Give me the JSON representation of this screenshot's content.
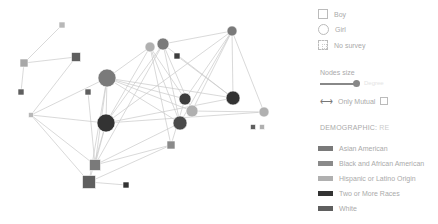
{
  "legend": {
    "shapes": [
      {
        "shape": "square",
        "label": "Boy"
      },
      {
        "shape": "circle",
        "label": "Girl"
      },
      {
        "shape": "no-survey",
        "label": "No survey"
      }
    ],
    "nodes_size": {
      "label": "Nodes size",
      "value": "Degree"
    },
    "only_mutual": {
      "label": "Only Mutual",
      "checked": false
    },
    "demographic": {
      "title": "DEMOGRAPHIC:",
      "selected": "RE",
      "categories": [
        {
          "label": "Asian American",
          "color": "#7a7a7a"
        },
        {
          "label": "Black and African American",
          "color": "#8a8a8a"
        },
        {
          "label": "Hispanic or Latino Origin",
          "color": "#b0b0b0"
        },
        {
          "label": "Two or More Races",
          "color": "#333333"
        },
        {
          "label": "White",
          "color": "#5f5f5f"
        }
      ]
    }
  },
  "graph": {
    "nodes": [
      {
        "id": "n1",
        "shape": "square",
        "x": 62,
        "y": 25,
        "size": 6,
        "color": "#b8b8b8"
      },
      {
        "id": "n2",
        "shape": "square",
        "x": 24,
        "y": 63,
        "size": 8,
        "color": "#a8a8a8"
      },
      {
        "id": "n3",
        "shape": "square",
        "x": 76,
        "y": 57,
        "size": 9,
        "color": "#5f5f5f"
      },
      {
        "id": "n4",
        "shape": "square",
        "x": 21,
        "y": 92,
        "size": 6,
        "color": "#5f5f5f"
      },
      {
        "id": "n5",
        "shape": "circle",
        "x": 107,
        "y": 78,
        "size": 9,
        "color": "#7a7a7a"
      },
      {
        "id": "n6",
        "shape": "square",
        "x": 88,
        "y": 92,
        "size": 6,
        "color": "#5f5f5f"
      },
      {
        "id": "n7",
        "shape": "square",
        "x": 31,
        "y": 115,
        "size": 5,
        "color": "#b8b8b8"
      },
      {
        "id": "n8",
        "shape": "circle",
        "x": 106,
        "y": 123,
        "size": 9,
        "color": "#333333"
      },
      {
        "id": "n9",
        "shape": "square",
        "x": 95,
        "y": 165,
        "size": 11,
        "color": "#7a7a7a"
      },
      {
        "id": "n10",
        "shape": "square",
        "x": 89,
        "y": 182,
        "size": 13,
        "color": "#5f5f5f"
      },
      {
        "id": "n11",
        "shape": "square",
        "x": 126,
        "y": 185,
        "size": 6,
        "color": "#333333"
      },
      {
        "id": "n12",
        "shape": "square",
        "x": 171,
        "y": 145,
        "size": 8,
        "color": "#8a8a8a"
      },
      {
        "id": "n13",
        "shape": "circle",
        "x": 150,
        "y": 47,
        "size": 5,
        "color": "#b0b0b0"
      },
      {
        "id": "n14",
        "shape": "circle",
        "x": 163,
        "y": 44,
        "size": 6,
        "color": "#7a7a7a"
      },
      {
        "id": "n15",
        "shape": "square",
        "x": 177,
        "y": 56,
        "size": 6,
        "color": "#3d3d3d"
      },
      {
        "id": "n16",
        "shape": "circle",
        "x": 232,
        "y": 31,
        "size": 5,
        "color": "#7a7a7a"
      },
      {
        "id": "n17",
        "shape": "circle",
        "x": 185,
        "y": 99,
        "size": 6,
        "color": "#3d3d3d"
      },
      {
        "id": "n18",
        "shape": "circle",
        "x": 192,
        "y": 111,
        "size": 6,
        "color": "#b0b0b0"
      },
      {
        "id": "n19",
        "shape": "circle",
        "x": 233,
        "y": 98,
        "size": 7,
        "color": "#333333"
      },
      {
        "id": "n20",
        "shape": "circle",
        "x": 180,
        "y": 123,
        "size": 7,
        "color": "#4a4a4a"
      },
      {
        "id": "n21",
        "shape": "circle",
        "x": 264,
        "y": 112,
        "size": 5,
        "color": "#b0b0b0"
      },
      {
        "id": "n22",
        "shape": "square",
        "x": 253,
        "y": 127,
        "size": 5,
        "color": "#5f5f5f"
      },
      {
        "id": "n23",
        "shape": "square",
        "x": 262,
        "y": 127,
        "size": 5,
        "color": "#b0b0b0"
      }
    ],
    "edges": [
      [
        "n1",
        "n2"
      ],
      [
        "n2",
        "n3"
      ],
      [
        "n2",
        "n4"
      ],
      [
        "n3",
        "n7"
      ],
      [
        "n7",
        "n5"
      ],
      [
        "n7",
        "n8"
      ],
      [
        "n7",
        "n9"
      ],
      [
        "n7",
        "n10"
      ],
      [
        "n5",
        "n13"
      ],
      [
        "n5",
        "n17"
      ],
      [
        "n5",
        "n18"
      ],
      [
        "n5",
        "n20"
      ],
      [
        "n5",
        "n19"
      ],
      [
        "n5",
        "n9"
      ],
      [
        "n5",
        "n10"
      ],
      [
        "n5",
        "n8"
      ],
      [
        "n6",
        "n9"
      ],
      [
        "n8",
        "n9"
      ],
      [
        "n8",
        "n10"
      ],
      [
        "n8",
        "n13"
      ],
      [
        "n8",
        "n14"
      ],
      [
        "n8",
        "n19"
      ],
      [
        "n8",
        "n16"
      ],
      [
        "n8",
        "n21"
      ],
      [
        "n13",
        "n17"
      ],
      [
        "n13",
        "n20"
      ],
      [
        "n13",
        "n12"
      ],
      [
        "n14",
        "n19"
      ],
      [
        "n14",
        "n20"
      ],
      [
        "n14",
        "n18"
      ],
      [
        "n15",
        "n19"
      ],
      [
        "n16",
        "n14"
      ],
      [
        "n16",
        "n17"
      ],
      [
        "n16",
        "n18"
      ],
      [
        "n16",
        "n20"
      ],
      [
        "n16",
        "n19"
      ],
      [
        "n16",
        "n21"
      ],
      [
        "n9",
        "n12"
      ],
      [
        "n10",
        "n12"
      ],
      [
        "n10",
        "n11"
      ],
      [
        "n9",
        "n20"
      ],
      [
        "n18",
        "n21"
      ],
      [
        "n17",
        "n12"
      ],
      [
        "n9",
        "n14"
      ]
    ]
  }
}
